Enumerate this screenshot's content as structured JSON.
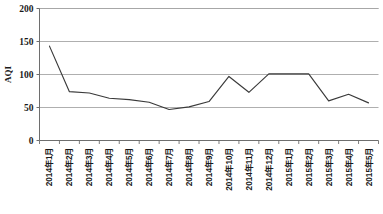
{
  "chart_data": {
    "type": "line",
    "title": "",
    "xlabel": "",
    "ylabel": "AQI",
    "ylim": [
      0,
      200
    ],
    "yticks": [
      0,
      50,
      100,
      150,
      200
    ],
    "ytick_labels": [
      "0",
      "50",
      "100",
      "150",
      "200"
    ],
    "grid": true,
    "grid_axis": "y",
    "legend": false,
    "legend_position": "none",
    "line_color": "#3a3a3a",
    "grid_color": "#a6a6a6",
    "axis_color": "#808080",
    "background_color": "#ffffff",
    "categories": [
      "2014年1月",
      "2014年2月",
      "2014年3月",
      "2014年4月",
      "2014年5月",
      "2014年6月",
      "2014年7月",
      "2014年8月",
      "2014年9月",
      "2014年10月",
      "2014年11月",
      "2014年12月",
      "2015年1月",
      "2015年2月",
      "2015年3月",
      "2015年4月",
      "2015年5月"
    ],
    "series": [
      {
        "name": "AQI",
        "values": [
          143,
          74,
          72,
          64,
          62,
          58,
          47,
          51,
          59,
          97,
          73,
          101,
          101,
          101,
          60,
          70,
          57
        ]
      }
    ]
  }
}
